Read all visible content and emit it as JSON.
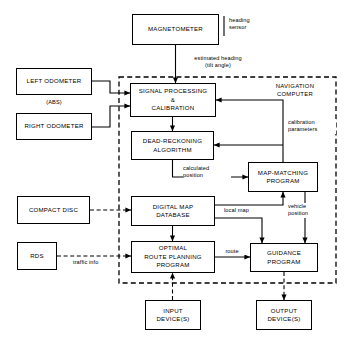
{
  "diagram": {
    "region_label": "NAVIGATION\nCOMPUTER",
    "boxes": {
      "magnetometer": "MAGNETOMETER",
      "left_odometer": "LEFT ODOMETER",
      "right_odometer": "RIGHT ODOMETER",
      "abs_note": "(ABS)",
      "compact_disc": "COMPACT DISC",
      "rds": "RDS",
      "signal_processing": "SIGNAL PROCESSING\n&\nCALIBRATION",
      "dead_reckoning": "DEAD-RECKONING\nALGORITHM",
      "map_matching": "MAP-MATCHING\nPROGRAM",
      "digital_map": "DIGITAL MAP\nDATABASE",
      "optimal_route": "OPTIMAL\nROUTE PLANNING\nPROGRAM",
      "guidance": "GUIDANCE\nPROGRAM",
      "input_device": "INPUT\nDEVICE(S)",
      "output_device": "OUTPUT\nDEVICE(S)"
    },
    "edge_labels": {
      "heading_sensor": "heading\nsensor",
      "estimated_heading": "estimated heading\n(tilt angle)",
      "calibration_parameters": "calibration\nparameters",
      "calculated_position": "calculated\nposition",
      "local_map": "local map",
      "vehicle_position": "vehicle\nposition",
      "traffic_info": "traffic info",
      "route": "route"
    },
    "colors": {
      "line": "#000000",
      "background": "#ffffff"
    }
  }
}
